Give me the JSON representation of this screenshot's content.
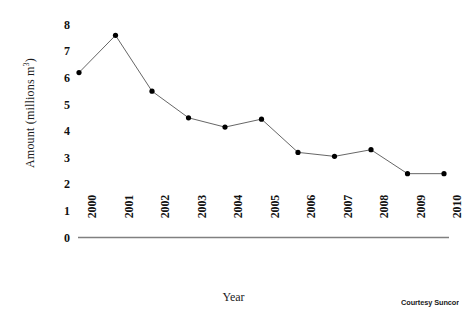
{
  "figure": {
    "background_color": "#ffffff",
    "credit": "Courtesy Suncor"
  },
  "chart_data": {
    "type": "line",
    "title": "",
    "xlabel": "Year",
    "ylabel": "Amount (millions m³)",
    "ylabel_base": "Amount (millions m",
    "ylabel_sup": "3",
    "ylabel_close": ")",
    "categories": [
      "2000",
      "2001",
      "2002",
      "2003",
      "2004",
      "2005",
      "2006",
      "2007",
      "2008",
      "2009",
      "2010"
    ],
    "values": [
      6.2,
      7.6,
      5.5,
      4.5,
      4.15,
      4.45,
      3.2,
      3.05,
      3.3,
      2.4,
      2.4
    ],
    "series": [
      {
        "name": "Amount",
        "values": [
          6.2,
          7.6,
          5.5,
          4.5,
          4.15,
          4.45,
          3.2,
          3.05,
          3.3,
          2.4,
          2.4
        ],
        "line_color": "#555555",
        "marker_color": "#000000"
      }
    ],
    "yticks": [
      "8",
      "7",
      "6",
      "5",
      "4",
      "3",
      "2",
      "1",
      "0"
    ],
    "ytick_values": [
      8,
      7,
      6,
      5,
      4,
      3,
      2,
      1,
      0
    ],
    "ylim": [
      0,
      8
    ],
    "grid": false,
    "legend": "none",
    "axis_color": "#808080"
  }
}
